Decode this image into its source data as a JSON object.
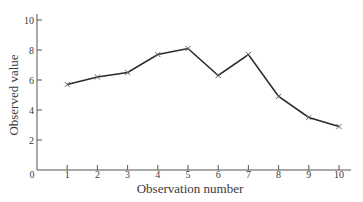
{
  "chart_data": {
    "type": "line",
    "title": "",
    "xlabel": "Observation number",
    "ylabel": "Observed value",
    "x": [
      1,
      2,
      3,
      4,
      5,
      6,
      7,
      8,
      9,
      10
    ],
    "values": [
      5.7,
      6.2,
      6.5,
      7.7,
      8.1,
      6.3,
      7.7,
      4.9,
      3.5,
      2.9
    ],
    "series": [
      {
        "name": "Observed value",
        "marker": "x",
        "values": [
          5.7,
          6.2,
          6.5,
          7.7,
          8.1,
          6.3,
          7.7,
          4.9,
          3.5,
          2.9
        ]
      }
    ],
    "xticks": [
      "1",
      "2",
      "3",
      "4",
      "5",
      "6",
      "7",
      "8",
      "9",
      "10"
    ],
    "yticks": [
      "2",
      "4",
      "6",
      "8",
      "10"
    ],
    "origin_label": "0",
    "xlim": [
      0,
      10.4
    ],
    "ylim": [
      0,
      10.5
    ],
    "grid": false,
    "legend": null,
    "colors": {
      "line": "#2b2b2b",
      "marker": "#6a6a6a",
      "axis": "#555555",
      "text": "#3a3a3a"
    }
  }
}
